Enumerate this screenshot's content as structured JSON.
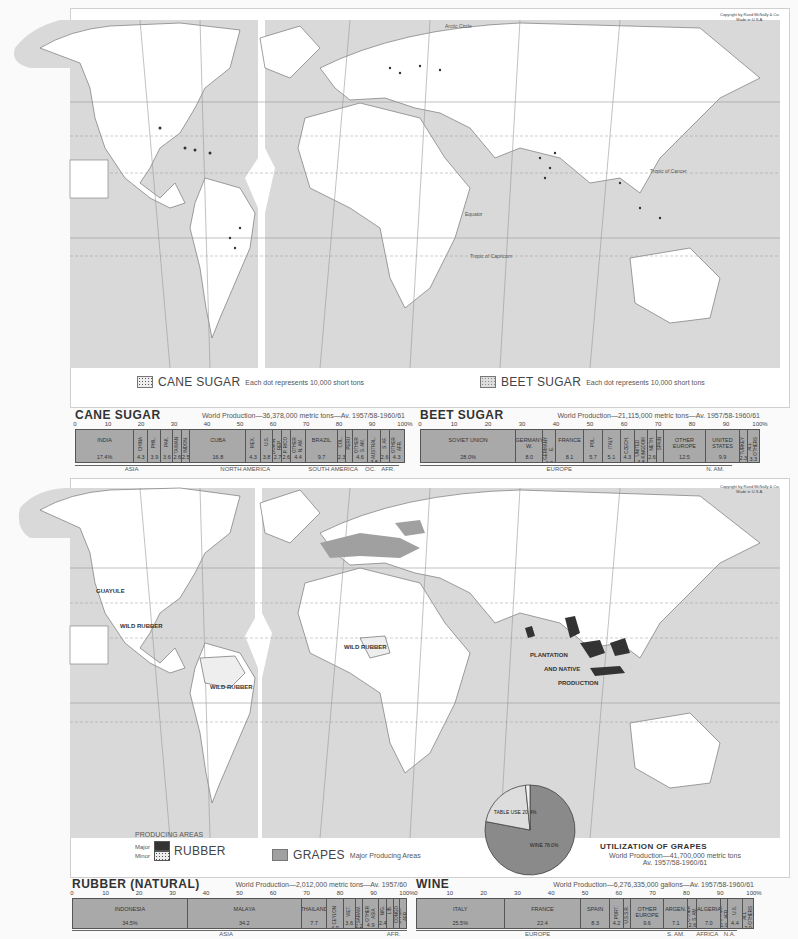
{
  "top_map": {
    "copyright": [
      "Copyright by Rand McNally & Co.",
      "Made in U.S.A."
    ],
    "labels": [
      "Arctic Circle",
      "Tropic of Cancer",
      "Equator",
      "Tropic of Capricorn"
    ],
    "legend": [
      {
        "label": "CANE SUGAR",
        "note": "Each dot represents 10,000 short tons"
      },
      {
        "label": "BEET SUGAR",
        "note": "Each dot represents 10,000 short tons"
      }
    ]
  },
  "bottom_map": {
    "copyright": [
      "Copyright by Rand McNally & Co.",
      "Made in U.S.A."
    ],
    "labels": [
      "Arctic Circle",
      "Tropic of Cancer",
      "Equator",
      "Tropic of Capricorn"
    ],
    "map_labels": [
      "GUAYULE",
      "WILD RUBBER",
      "WILD RUBBER",
      "WILD RUBBER",
      "PLANTATION",
      "AND NATIVE",
      "PRODUCTION"
    ],
    "legend": {
      "producing_areas": "PRODUCING AREAS",
      "major": "Major",
      "minor": "Minor",
      "rubber": "RUBBER",
      "grapes": "GRAPES",
      "grapes_note": "Major Producing Areas"
    }
  },
  "colors": {
    "ocean": "#d9d9d9",
    "bar": "#a9a9a9",
    "rubber_major": "#333333",
    "grapes": "#a0a0a0",
    "pie_wine": "#8a8a8a",
    "pie_table": "#dddddd",
    "pie_raisins": "#f2f2f2"
  },
  "ticks": [
    "0",
    "10",
    "20",
    "30",
    "40",
    "50",
    "60",
    "70",
    "80",
    "90",
    "100%"
  ],
  "chart_data": [
    {
      "type": "bar",
      "title": "CANE SUGAR",
      "subtitle": "World Production—36,378,000 metric tons—Av. 1957/58-1960/61",
      "xlabel": "",
      "ylabel": "Percent of world production",
      "ylim": [
        0,
        100
      ],
      "categories": [
        "INDIA",
        "CHINA",
        "PHIL.",
        "PAK.",
        "TAIWAN",
        "INDON.",
        "CUBA",
        "MEX.",
        "U.S.",
        "DOMIN. REP.",
        "P. RICO",
        "OTHER N. AM.",
        "BRAZIL",
        "COL.",
        "PERU",
        "OTHER S. AM.",
        "AUSTRAL.",
        "S. AF.",
        "OTHER AFR."
      ],
      "values": [
        17.4,
        4.3,
        3.9,
        3.6,
        2.6,
        2.5,
        16.8,
        4.3,
        3.8,
        2.7,
        2.6,
        4.4,
        9.7,
        2.3,
        2.1,
        4.6,
        3.8,
        2.6,
        4.3
      ],
      "labels_shown": [
        "17.4%",
        "4.3",
        "3.9",
        "3.6",
        "2.6",
        "2.5",
        "16.8",
        "4.3",
        "3.8",
        "2.7",
        "2.6",
        "4.4",
        "9.7",
        "2.3",
        "",
        "4.6",
        "3.8",
        "2.6",
        "4.3"
      ],
      "regions": [
        {
          "name": "ASIA",
          "span": 34.3
        },
        {
          "name": "NORTH AMERICA",
          "span": 34.6
        },
        {
          "name": "SOUTH AMERICA",
          "span": 18.7
        },
        {
          "name": "OC.",
          "span": 3.8
        },
        {
          "name": "AFR.",
          "span": 6.9
        }
      ]
    },
    {
      "type": "bar",
      "title": "BEET SUGAR",
      "subtitle": "World Production—21,115,000 metric tons—Av. 1957/58-1960/61",
      "xlabel": "",
      "ylabel": "Percent of world production",
      "ylim": [
        0,
        100
      ],
      "categories": [
        "SOVIET UNION",
        "GERMANY W.",
        "GERMANY E.",
        "FRANCE",
        "POL.",
        "ITALY",
        "CZECH.",
        "UNITED KINGDOM",
        "NETH.",
        "SPAIN",
        "OTHER EUROPE",
        "UNITED STATES",
        "TURKEY",
        "ALL OTHERS"
      ],
      "values": [
        28.0,
        8.0,
        3.8,
        8.1,
        5.7,
        5.1,
        4.3,
        3.8,
        2.6,
        2.0,
        12.5,
        9.9,
        2.3,
        3.3
      ],
      "labels_shown": [
        "28.0%",
        "8.0",
        "3.8",
        "8.1",
        "5.7",
        "5.1",
        "4.3",
        "3.8",
        "2.6",
        "",
        "12.5",
        "9.9",
        "2.3",
        "3.3"
      ],
      "regions": [
        {
          "name": "EUROPE",
          "span": 81.9
        },
        {
          "name": "N. AM.",
          "span": 9.9
        }
      ]
    },
    {
      "type": "bar",
      "title": "RUBBER (NATURAL)",
      "subtitle": "World Production—2,012,000 metric tons—Av. 1957/60",
      "xlabel": "",
      "ylabel": "Percent of world production",
      "ylim": [
        0,
        100
      ],
      "categories": [
        "INDONESIA",
        "MALAYA",
        "THAILAND",
        "CEYLON",
        "VIET.",
        "SARAW.",
        "OTHER ASIA",
        "NIG.",
        "LIB.",
        "CONGO",
        "OTHER AFR."
      ],
      "values": [
        34.5,
        34.2,
        7.7,
        4.9,
        3.6,
        2.2,
        4.9,
        2.4,
        2.0,
        1.9,
        1.7
      ],
      "labels_shown": [
        "34.5%",
        "34.2",
        "7.7",
        "4.9",
        "3.6",
        "2.2",
        "4.9",
        "2.4",
        "",
        "",
        ""
      ],
      "regions": [
        {
          "name": "ASIA",
          "span": 92.0
        },
        {
          "name": "AFR.",
          "span": 8.0
        }
      ]
    },
    {
      "type": "bar",
      "title": "WINE",
      "subtitle": "World Production—6,276,335,000 gallons—Av. 1957/58-1960/61",
      "xlabel": "",
      "ylabel": "Percent of world production",
      "ylim": [
        0,
        100
      ],
      "categories": [
        "ITALY",
        "FRANCE",
        "SPAIN",
        "PORT.",
        "U.S.S.R.",
        "OTHER EUROPE",
        "ARGEN.",
        "OTHER S. AM.",
        "ALGERIA",
        "OTHER AFR.",
        "U.S.",
        "ALL OTHERS"
      ],
      "values": [
        25.5,
        22.4,
        8.3,
        4.2,
        2.0,
        9.6,
        7.1,
        2.6,
        7.0,
        1.9,
        4.4,
        2.9
      ],
      "labels_shown": [
        "25.5%",
        "22.4",
        "8.3",
        "4.2",
        "",
        "9.6",
        "7.1",
        "2.6",
        "7.0",
        "1.9",
        "4.4",
        "2.9"
      ],
      "regions": [
        {
          "name": "EUROPE",
          "span": 72.0
        },
        {
          "name": "S. AM.",
          "span": 9.7
        },
        {
          "name": "AFRICA",
          "span": 8.9
        },
        {
          "name": "N.A.",
          "span": 4.4
        }
      ]
    },
    {
      "type": "pie",
      "title": "UTILIZATION OF GRAPES",
      "subtitle": "World Production—41,700,000 metric tons",
      "subtitle2": "Av. 1957/58-1960/61",
      "categories": [
        "WINE",
        "TABLE USE",
        "RAISINS"
      ],
      "values": [
        78.0,
        20.4,
        1.6
      ],
      "labels_shown": [
        "WINE 78.0%",
        "TABLE USE 20.4%",
        "RAISINS 1.6%"
      ]
    }
  ]
}
